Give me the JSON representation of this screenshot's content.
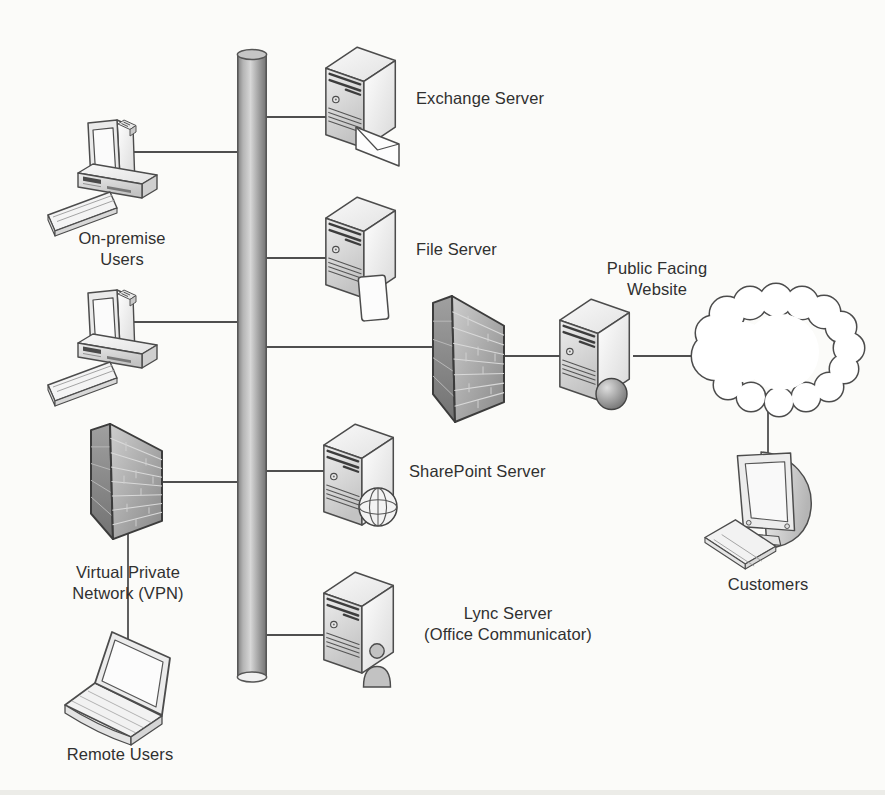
{
  "canvas": {
    "width": 885,
    "height": 795,
    "background": "#fbfbf9"
  },
  "diagram": {
    "type": "network-topology",
    "nodes": {
      "on_premise_users": {
        "label": "On-premise\nUsers",
        "icon": "desktop-pc",
        "count": 2
      },
      "exchange_server": {
        "label": "Exchange Server",
        "icon": "server-tower-envelope"
      },
      "file_server": {
        "label": "File Server",
        "icon": "server-tower-document"
      },
      "sharepoint_server": {
        "label": "SharePoint Server",
        "icon": "server-tower-globe-wireframe"
      },
      "lync_server": {
        "label": "Lync Server\n(Office Communicator)",
        "icon": "server-tower-person"
      },
      "public_facing_website": {
        "label": "Public Facing\nWebsite",
        "icon": "server-tower-sphere"
      },
      "perimeter_firewall": {
        "label": "",
        "icon": "firewall-brick-wall"
      },
      "vpn_firewall": {
        "label": "Virtual Private\nNetwork (VPN)",
        "icon": "firewall-brick-wall"
      },
      "remote_users": {
        "label": "Remote Users",
        "icon": "laptop"
      },
      "internet": {
        "label": "",
        "icon": "cloud"
      },
      "customers": {
        "label": "Customers",
        "icon": "crt-monitor-with-keyboard"
      },
      "backbone": {
        "label": "",
        "icon": "network-backbone-pipe"
      }
    },
    "connections": [
      "on-premise-pc-1 — backbone",
      "on-premise-pc-2 — backbone",
      "backbone — exchange-server",
      "backbone — file-server",
      "backbone — perimeter-firewall",
      "perimeter-firewall — public-facing-website",
      "public-facing-website — internet-cloud",
      "internet-cloud — customers",
      "vpn-firewall — backbone",
      "backbone — sharepoint-server",
      "backbone — lync-server",
      "vpn-firewall — remote-users-laptop"
    ],
    "colors": {
      "outline": "#4c4c4c",
      "connector": "#4f4f4f",
      "text": "#303030"
    }
  }
}
